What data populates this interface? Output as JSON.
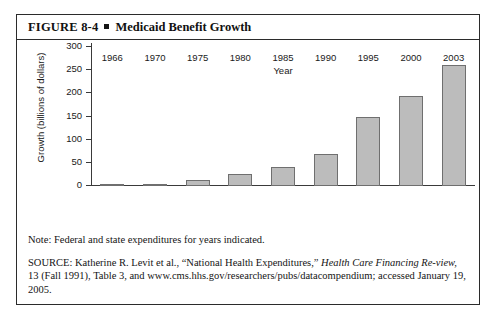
{
  "figure": {
    "label": "FIGURE 8-4",
    "title": "Medicaid Benefit Growth",
    "bullet": "square-bullet"
  },
  "notes": {
    "note": "Note: Federal and state expenditures for years indicated.",
    "source_part1": "SOURCE: Katherine R. Levit et al., “National Health Expenditures,” ",
    "source_italic1": "Health Care Financing Re-",
    "source_italic2": "view,",
    "source_part2": " 13 (Fall 1991), Table 3, and www.cms.hhs.gov/researchers/pubs/datacompendium; accessed January 19, 2005."
  },
  "chart_data": {
    "type": "bar",
    "title": "Medicaid Benefit Growth",
    "xlabel": "Year",
    "ylabel": "Growth (billions of dollars)",
    "categories": [
      "1966",
      "1970",
      "1975",
      "1980",
      "1985",
      "1990",
      "1995",
      "2000",
      "2003"
    ],
    "values": [
      2,
      5,
      14,
      26,
      41,
      69,
      148,
      195,
      262
    ],
    "ylim": [
      0,
      300
    ],
    "yticks": [
      0,
      50,
      100,
      150,
      200,
      250,
      300
    ],
    "grid": false,
    "legend": false,
    "bar_color": "#bcbcbc",
    "bar_edge_color": "#6f6f6f",
    "axis_color": "#3a3a3a"
  }
}
